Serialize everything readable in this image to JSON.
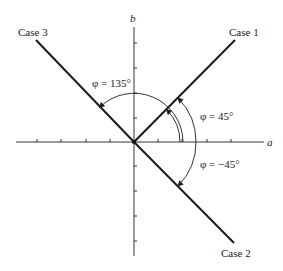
{
  "axes": {
    "x_label": "a",
    "y_label": "b"
  },
  "cases": [
    {
      "label": "Case 1",
      "angle_label": "φ = 45°",
      "angle_deg": 45
    },
    {
      "label": "Case 2",
      "angle_label": "φ = −45°",
      "angle_deg": -45
    },
    {
      "label": "Case 3",
      "angle_label": "φ = 135°",
      "angle_deg": 135
    }
  ],
  "colors": {
    "line": "#1a1a1a",
    "axis": "#333333",
    "background": "#ffffff"
  }
}
